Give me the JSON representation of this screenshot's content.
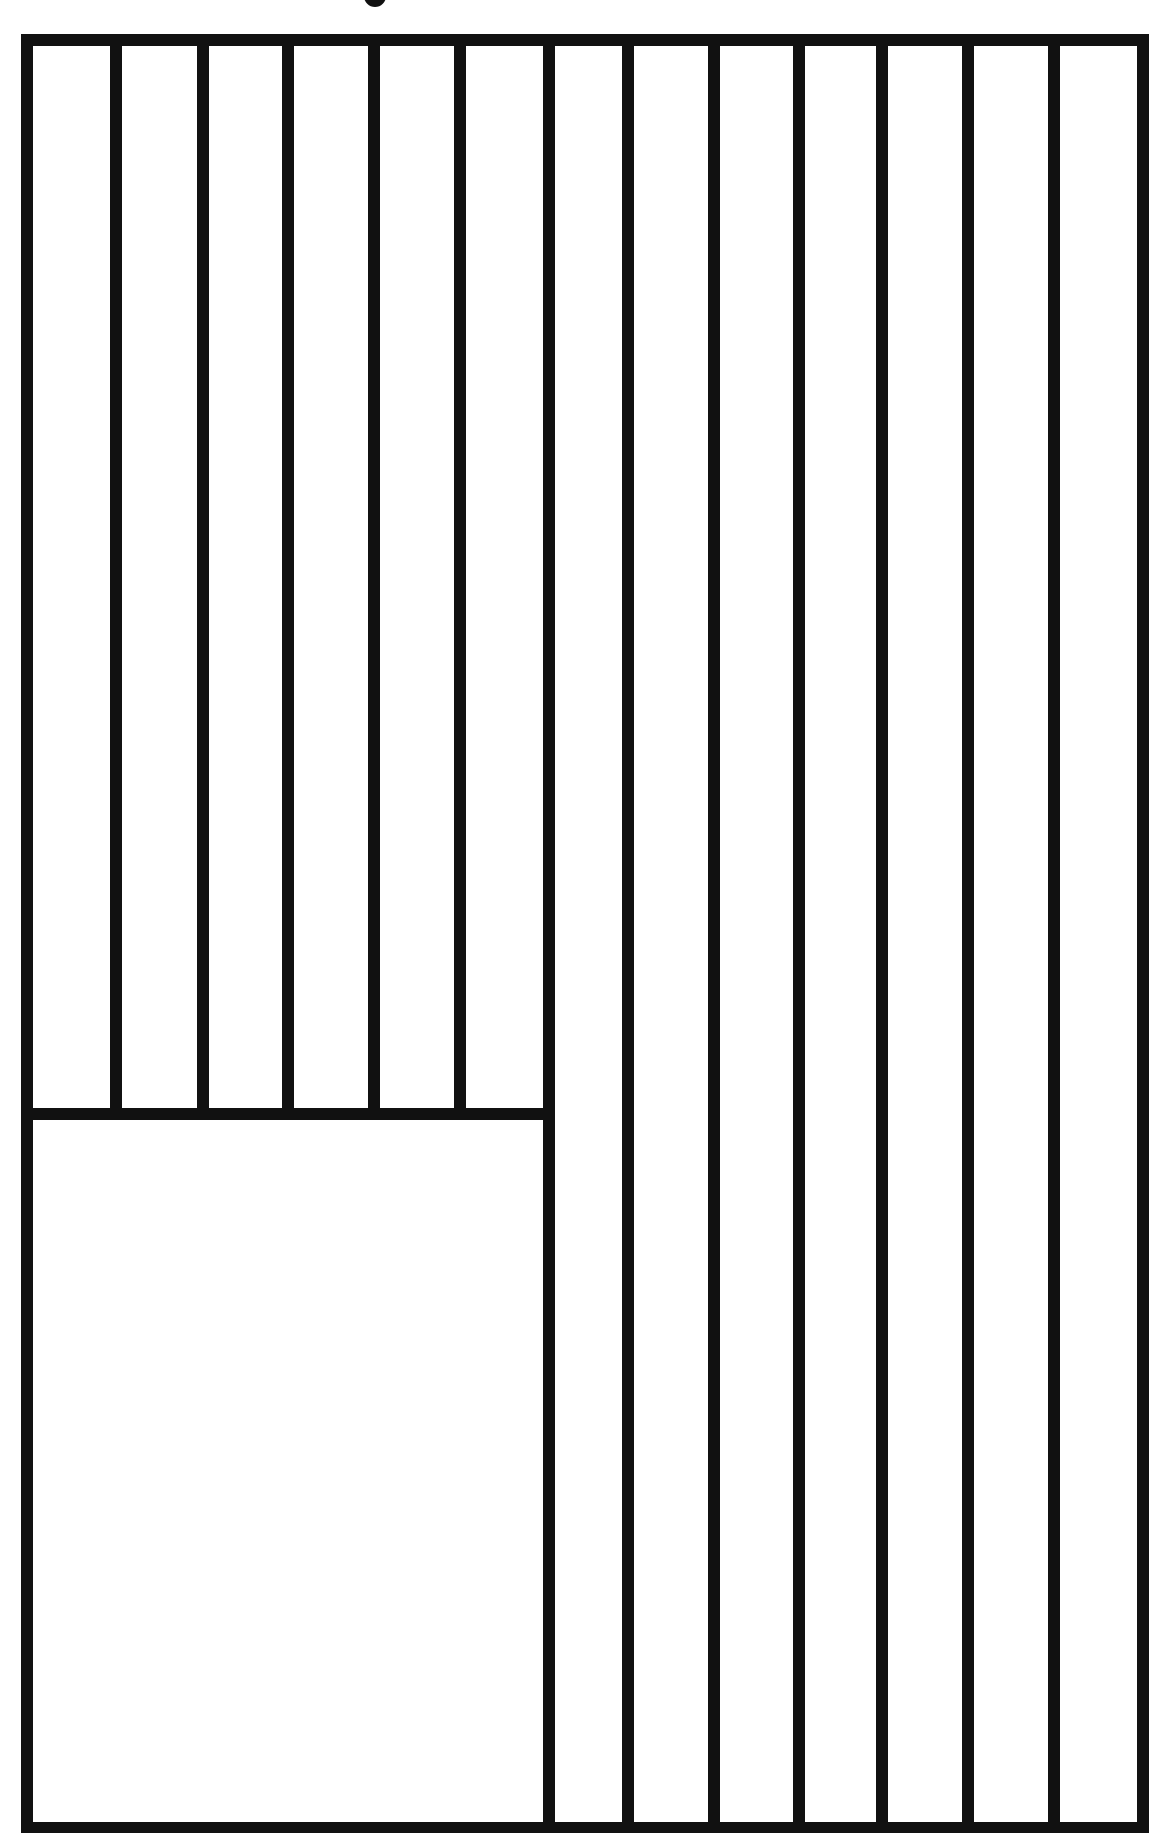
{
  "caption": {
    "visible_text": "",
    "note_clipped": true
  },
  "diagram": {
    "type": "rectangular-panel-layout",
    "stroke_color": "#111111",
    "background": "#ffffff",
    "stroke_width": 12,
    "outer_frame": {
      "x1": 27,
      "y1": 40,
      "x2": 1143,
      "y2": 1828
    },
    "lower_left_box": {
      "x1": 27,
      "y1": 1114,
      "x2": 549,
      "y2": 1828
    },
    "upper_left_verticals_x": [
      116,
      203,
      288,
      374,
      460
    ],
    "upper_left_bottom_y": 1114,
    "full_height_verticals_x": [
      549,
      628,
      714,
      799,
      882,
      968,
      1054
    ],
    "columns": {
      "upper_left_count": 6,
      "right_count": 7
    }
  }
}
